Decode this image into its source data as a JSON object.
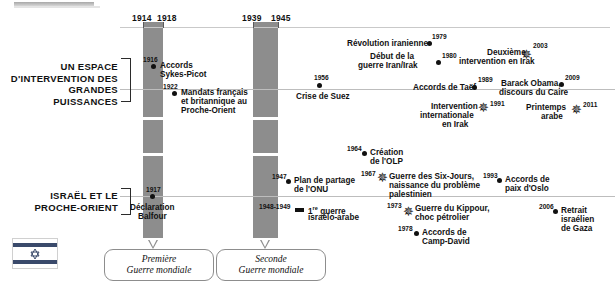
{
  "figure": {
    "type": "timeline",
    "language": "fr",
    "rows": [
      {
        "id": "row-puissances",
        "title": "UN ESPACE\nD'INTERVENTION DES\nGRANDES PUISSANCES"
      },
      {
        "id": "row-israel",
        "title": "ISRAËL ET LE\nPROCHE-ORIENT"
      }
    ]
  },
  "ruler": {
    "years": [
      "1914",
      "1918",
      "1939",
      "1945"
    ]
  },
  "bands": [
    {
      "name": "premiere-guerre-mondiale",
      "start": "1914",
      "end": "1918",
      "callout": "Première\nGuerre mondiale",
      "line1": "Première",
      "line2": "Guerre mondiale"
    },
    {
      "name": "seconde-guerre-mondiale",
      "start": "1939",
      "end": "1945",
      "callout": "Seconde\nGuerre mondiale",
      "line1": "Seconde",
      "line2": "Guerre mondiale"
    }
  ],
  "events": [
    {
      "id": "e1",
      "row": "row-puissances",
      "year": "1916",
      "marker": "dot",
      "label": "Accords\nSykes-Picot",
      "line1": "Accords",
      "line2": "Sykes-Picot",
      "line3": ""
    },
    {
      "id": "e2",
      "row": "row-puissances",
      "year": "1922",
      "marker": "dot",
      "label": "Mandats français\net britannique au\nProche-Orient",
      "line1": "Mandats français",
      "line2": "et britannique au",
      "line3": "Proche-Orient"
    },
    {
      "id": "e3",
      "row": "row-puissances",
      "year": "1956",
      "marker": "dot",
      "label": "Crise de Suez",
      "line1": "Crise de Suez",
      "line2": "",
      "line3": ""
    },
    {
      "id": "e4",
      "row": "row-puissances",
      "year": "1979",
      "marker": "dot",
      "label": "Révolution iranienne",
      "line1": "Révolution iranienne",
      "line2": "",
      "line3": ""
    },
    {
      "id": "e5",
      "row": "row-puissances",
      "year": "1980",
      "marker": "dot",
      "label": "Début de la\nguerre Iran/Irak",
      "line1": "Début de la",
      "line2": "guerre Iran/Irak",
      "line3": ""
    },
    {
      "id": "e6",
      "row": "row-puissances",
      "year": "1989",
      "marker": "dot",
      "label": "Accords de Taëf",
      "line1": "Accords de Taëf",
      "line2": "",
      "line3": ""
    },
    {
      "id": "e7",
      "row": "row-puissances",
      "year": "1991",
      "marker": "star",
      "label": "Intervention\ninternationale\nen Irak",
      "line1": "Intervention",
      "line2": "internationale",
      "line3": "en Irak"
    },
    {
      "id": "e8",
      "row": "row-puissances",
      "year": "2003",
      "marker": "star",
      "label": "Deuxième\nintervention en Irak",
      "line1": "Deuxième",
      "line2": "intervention en Irak",
      "line3": ""
    },
    {
      "id": "e9",
      "row": "row-puissances",
      "year": "2009",
      "marker": "dot",
      "label": "Barack Obama,\ndiscours du Caire",
      "line1": "Barack Obama,",
      "line2": "discours du Caire",
      "line3": ""
    },
    {
      "id": "e10",
      "row": "row-puissances",
      "year": "2011",
      "marker": "star",
      "label": "Printemps\narabe",
      "line1": "Printemps",
      "line2": "arabe",
      "line3": ""
    },
    {
      "id": "e11",
      "row": "row-israel",
      "year": "1917",
      "marker": "dot",
      "label": "Déclaration\nBalfour",
      "line1": "Déclaration",
      "line2": "Balfour",
      "line3": ""
    },
    {
      "id": "e12",
      "row": "row-israel",
      "year": "1947",
      "marker": "dot",
      "label": "Plan de partage\nde l'ONU",
      "line1": "Plan de partage",
      "line2": "de l'ONU",
      "line3": ""
    },
    {
      "id": "e13",
      "row": "row-israel",
      "year": "1948-1949",
      "marker": "bar",
      "label": "1re guerre\nisraélo-arabe",
      "line1": "1",
      "line1sup": "re",
      "line1b": " guerre",
      "line2": "israélo-arabe",
      "line3": ""
    },
    {
      "id": "e14",
      "row": "row-israel",
      "year": "1964",
      "marker": "dot",
      "label": "Création\nde l'OLP",
      "line1": "Création",
      "line2": "de l'OLP",
      "line3": ""
    },
    {
      "id": "e15",
      "row": "row-israel",
      "year": "1967",
      "marker": "star",
      "label": "Guerre des Six-Jours,\nnaissance du problème\npalestinien",
      "line1": "Guerre des Six-Jours,",
      "line2": "naissance du problème",
      "line3": "palestinien"
    },
    {
      "id": "e16",
      "row": "row-israel",
      "year": "1973",
      "marker": "star",
      "label": "Guerre du Kippour,\nchoc pétrolier",
      "line1": "Guerre du Kippour,",
      "line2": "choc pétrolier",
      "line3": ""
    },
    {
      "id": "e17",
      "row": "row-israel",
      "year": "1978",
      "marker": "dot",
      "label": "Accords de\nCamp-David",
      "line1": "Accords de",
      "line2": "Camp-David",
      "line3": ""
    },
    {
      "id": "e18",
      "row": "row-israel",
      "year": "1993",
      "marker": "dot",
      "label": "Accords de\npaix d'Oslo",
      "line1": "Accords de",
      "line2": "paix d'Oslo",
      "line3": ""
    },
    {
      "id": "e19",
      "row": "row-israel",
      "year": "2006",
      "marker": "dot",
      "label": "Retrait\nisraélien\nde Gaza",
      "line1": "Retrait",
      "line2": "israélien",
      "line3": "de Gaza"
    }
  ],
  "icons": {
    "flag": "israel-flag-icon"
  },
  "colors": {
    "band": "#8d8d8d",
    "axis": "#bdbdbd",
    "text": "#111111",
    "callout_border": "#8d8d8d",
    "flag_blue": "#3a4a6b"
  }
}
